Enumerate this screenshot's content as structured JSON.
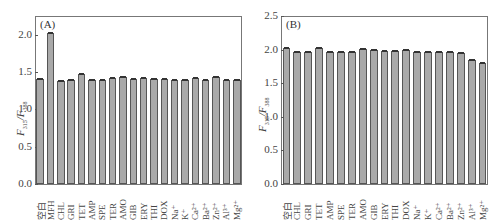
{
  "chart_data": [
    {
      "type": "bar",
      "panel_label": "(A)",
      "ylabel": "F315/F388",
      "ylabel_main1": "F",
      "ylabel_sub1": "315",
      "ylabel_main2": "/F",
      "ylabel_sub2": "388",
      "xlabel": "",
      "ylim": [
        0,
        2.25
      ],
      "yticks": [
        "0.0",
        "0.5",
        "1.0",
        "1.5",
        "2.0"
      ],
      "categories": [
        "空白",
        "MFH",
        "CHL",
        "GRI",
        "TET",
        "AMP",
        "SPE",
        "TER",
        "AMO",
        "GIB",
        "ERY",
        "THI",
        "DOX",
        "Na⁺",
        "K⁺",
        "Ca²⁺",
        "Ba²⁺",
        "Zn²⁺",
        "Al³⁺",
        "Mg²⁺"
      ],
      "values": [
        1.41,
        2.02,
        1.38,
        1.39,
        1.47,
        1.39,
        1.39,
        1.42,
        1.43,
        1.41,
        1.42,
        1.41,
        1.4,
        1.39,
        1.39,
        1.42,
        1.39,
        1.43,
        1.39,
        1.39
      ],
      "bar_color": "#a9a9a9",
      "grid": false
    },
    {
      "type": "bar",
      "panel_label": "(B)",
      "ylabel": "F315/F388",
      "ylabel_main1": "F",
      "ylabel_sub1": "315",
      "ylabel_main2": "/F",
      "ylabel_sub2": "388",
      "xlabel": "",
      "ylim": [
        0,
        2.5
      ],
      "yticks": [
        "0.0",
        "0.5",
        "1.0",
        "1.5",
        "2.0",
        "2.5"
      ],
      "categories": [
        "空白",
        "CHL",
        "GRI",
        "TET",
        "AMP",
        "SPE",
        "TER",
        "AMO",
        "GIB",
        "ERY",
        "THI",
        "DOX",
        "Na⁺",
        "K⁺",
        "Ca²⁺",
        "Ba²⁺",
        "Zn²⁺",
        "Al³⁺",
        "Mg²⁺"
      ],
      "values": [
        2.02,
        1.96,
        1.96,
        2.02,
        1.96,
        1.96,
        1.96,
        2.01,
        1.99,
        1.98,
        1.98,
        1.99,
        1.97,
        1.97,
        1.96,
        1.97,
        1.95,
        1.85,
        1.8
      ],
      "bar_color": "#a9a9a9",
      "grid": false
    }
  ]
}
